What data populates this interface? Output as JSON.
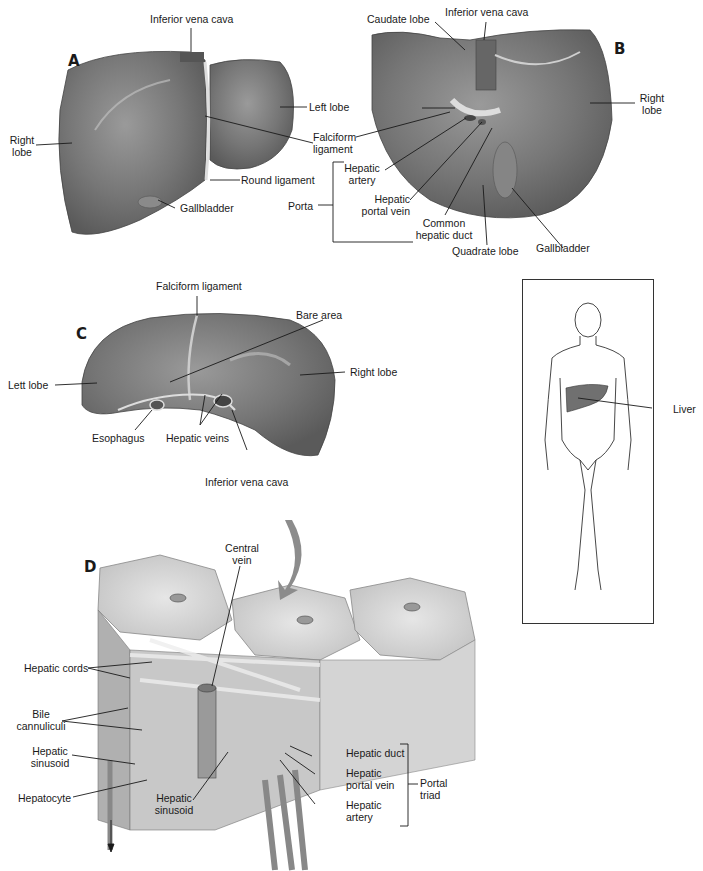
{
  "figure": {
    "panels": {
      "A": {
        "letter": "A",
        "labels": {
          "inferior_vena_cava": "Inferior vena cava",
          "right_lobe_1": "Right",
          "right_lobe_2": "lobe",
          "left_lobe": "Left lobe",
          "falciform_1": "Falciform",
          "falciform_2": "ligament",
          "round_ligament": "Round ligament",
          "gallbladder": "Gallbladder"
        }
      },
      "B": {
        "letter": "B",
        "labels": {
          "caudate_lobe": "Caudate lobe",
          "inferior_vena_cava": "Inferior vena cava",
          "right_lobe_1": "Right",
          "right_lobe_2": "lobe",
          "hepatic_artery_1": "Hepatic",
          "hepatic_artery_2": "artery",
          "hepatic_portal_vein_1": "Hepatic",
          "hepatic_portal_vein_2": "portal vein",
          "common_hepatic_duct_1": "Common",
          "common_hepatic_duct_2": "hepatic duct",
          "quadrate_lobe": "Quadrate lobe",
          "gallbladder": "Gallbladder",
          "porta": "Porta"
        }
      },
      "C": {
        "letter": "C",
        "labels": {
          "falciform_ligament": "Falciform ligament",
          "bare_area": "Bare area",
          "left_lobe": "Lett lobe",
          "right_lobe": "Right lobe",
          "esophagus": "Esophagus",
          "hepatic_veins": "Hepatic veins",
          "inferior_vena_cava": "Inferior vena cava"
        }
      },
      "body": {
        "labels": {
          "liver": "Liver"
        }
      },
      "D": {
        "letter": "D",
        "labels": {
          "central_vein_1": "Central",
          "central_vein_2": "vein",
          "hepatic_cords": "Hepatic cords",
          "bile_cannuliculi_1": "Bile",
          "bile_cannuliculi_2": "cannuliculi",
          "hepatic_sinusoid_left_1": "Hepatic",
          "hepatic_sinusoid_left_2": "sinusoid",
          "hepatocyte": "Hepatocyte",
          "hepatic_sinusoid_mid_1": "Hepatic",
          "hepatic_sinusoid_mid_2": "sinusoid",
          "hepatic_duct": "Hepatic duct",
          "hepatic_portal_vein_1": "Hepatic",
          "hepatic_portal_vein_2": "portal vein",
          "hepatic_artery_1": "Hepatic",
          "hepatic_artery_2": "artery",
          "portal_triad_1": "Portal",
          "portal_triad_2": "triad"
        }
      }
    },
    "colors": {
      "liver_fill": "#7a7a7a",
      "liver_dark": "#5e5e5e",
      "liver_highlight": "#a8a8a8",
      "lobule_fill": "#d6d6d6",
      "arrow_fill": "#8c8c8c",
      "line": "#1a1a1a"
    }
  }
}
